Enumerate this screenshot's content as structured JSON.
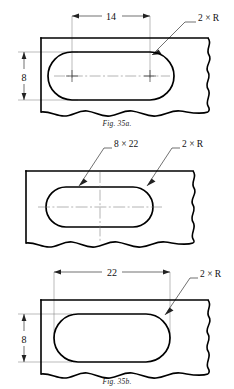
{
  "sheet": {
    "background_color": "#ffffff",
    "line_color": "#000000",
    "thin_line_color": "#555555",
    "figure_count": 3
  },
  "figures": [
    {
      "id": "fig-a",
      "caption": "Fig. 35a.",
      "title": "Slot dimensioned center-to-center with 2 × R note",
      "annotations": {
        "horizontal_dimension": "14",
        "vertical_dimension": "8",
        "radius_note": "2 × R"
      },
      "features": {
        "plate_edges": "top and left solid, right and bottom freehand break lines",
        "slot_shape": "obround / elongated hole with full radius ends",
        "center_marks": "small cross at each arc center",
        "centerline": "horizontal dash-dot through slot"
      }
    },
    {
      "id": "fig-b",
      "caption": "Fig. 35b.",
      "title": "Slot dimensioned by size note 8 × 22",
      "annotations": {
        "size_note": "8 × 22",
        "radius_note": "2 × R"
      },
      "features": {
        "plate_edges": "top, left solid, right and bottom freehand break lines",
        "slot_shape": "obround / elongated hole with full radius ends",
        "centerline": "crossed dash-dot centerlines, horizontal and vertical"
      }
    },
    {
      "id": "fig-c",
      "caption": "Fig. 35c.",
      "title": "Slot dimensioned overall length 22 and width 8",
      "annotations": {
        "horizontal_dimension": "22",
        "vertical_dimension": "8",
        "radius_note": "2 × R"
      },
      "features": {
        "plate_edges": "top and left solid, right and bottom freehand break lines",
        "slot_shape": "obround / elongated hole with full radius ends",
        "centerline": "none drawn"
      }
    }
  ]
}
